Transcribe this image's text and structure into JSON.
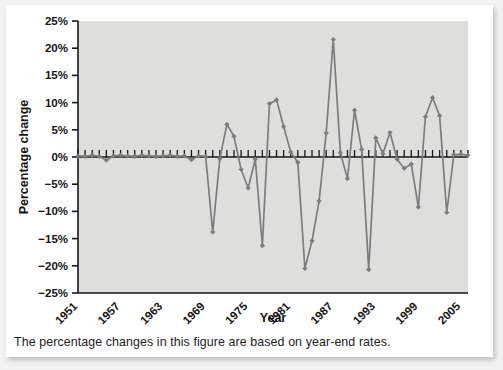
{
  "figure": {
    "caption": "The percentage changes in this figure are based on year-end rates.",
    "plot_bg_color": "#dededd",
    "line_color": "#7d7d7d",
    "axis_color": "#161616",
    "card_bg_color": "#ffffff",
    "page_bg_color": "#f2f2f2"
  },
  "chart_data": {
    "type": "line",
    "title": "",
    "xlabel": "Year",
    "ylabel": "Percentage change",
    "xlim": [
      1951,
      2006
    ],
    "ylim": [
      -25,
      25
    ],
    "yticks": [
      -25,
      -20,
      -15,
      -10,
      -5,
      0,
      5,
      10,
      15,
      20,
      25
    ],
    "ytick_labels": [
      "−25%",
      "−20%",
      "−15%",
      "−10%",
      "−5%",
      "0%",
      "5%",
      "10%",
      "15%",
      "20%",
      "25%"
    ],
    "xticks": [
      1951,
      1957,
      1963,
      1969,
      1975,
      1981,
      1987,
      1993,
      1999,
      2005
    ],
    "xtick_labels": [
      "1951",
      "1957",
      "1963",
      "1969",
      "1975",
      "1981",
      "1987",
      "1993",
      "1999",
      "2005"
    ],
    "grid": false,
    "legend": "none",
    "marker": "diamond",
    "x": [
      1951,
      1952,
      1953,
      1954,
      1955,
      1956,
      1957,
      1958,
      1959,
      1960,
      1961,
      1962,
      1963,
      1964,
      1965,
      1966,
      1967,
      1968,
      1969,
      1970,
      1971,
      1972,
      1973,
      1974,
      1975,
      1976,
      1977,
      1978,
      1979,
      1980,
      1981,
      1982,
      1983,
      1984,
      1985,
      1986,
      1987,
      1988,
      1989,
      1990,
      1991,
      1992,
      1993,
      1994,
      1995,
      1996,
      1997,
      1998,
      1999,
      2000,
      2001,
      2002,
      2003,
      2004,
      2005,
      2006
    ],
    "values": [
      0.2,
      0.1,
      0.3,
      0.1,
      -0.6,
      0.2,
      0.3,
      0.2,
      0.1,
      0.3,
      0.2,
      0.1,
      0.2,
      0.3,
      0.1,
      0.2,
      -0.5,
      0.2,
      0.1,
      -13.8,
      -0.3,
      6.0,
      3.8,
      -2.3,
      -5.7,
      -0.4,
      -16.3,
      9.8,
      10.5,
      5.6,
      0.9,
      -1.0,
      -20.5,
      -15.4,
      -8.1,
      4.4,
      21.6,
      0.8,
      -4.0,
      8.6,
      1.4,
      -20.7,
      3.5,
      0.6,
      4.5,
      -0.4,
      -2.1,
      -1.3,
      -9.2,
      7.4,
      10.9,
      7.6,
      -10.2,
      0.4,
      0.5,
      0.3
    ],
    "series_name": "Percentage change"
  },
  "icons": {
    "data_point": "diamond-marker"
  }
}
